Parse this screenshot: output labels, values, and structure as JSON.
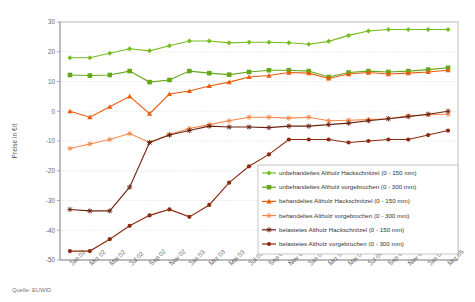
{
  "source_note": "Quelle: EUWID",
  "axes": {
    "ylabel": "Preise in €/t",
    "yticks": [
      "30",
      "20",
      "10",
      "0",
      "-10",
      "-20",
      "-30",
      "-40",
      "-50"
    ],
    "xticks": [
      "Jan 02",
      "Mrz 02",
      "Mai 02",
      "Jul 02",
      "Sep 02",
      "Nov 02",
      "Jan 03",
      "Mrz 03",
      "Mai 03",
      "Jul 03",
      "Sep 03",
      "Nov 03",
      "Jan 04",
      "Mrz 04",
      "Mai 04",
      "Jul 04",
      "Sep 04",
      "Nov 04",
      "Jan 05",
      "Mrz 05"
    ]
  },
  "legend": {
    "items": [
      {
        "label": "unbehandeltes Altholz Hackschnitzel (0 - 150 mm)",
        "color": "#76bc21",
        "marker": "diamond-marker"
      },
      {
        "label": "unbehandeltes Altholz vorgebrochen (0 - 300 mm)",
        "color": "#64a81a",
        "marker": "square-marker"
      },
      {
        "label": "behandeltes Altholz Hackschnitzel (0 - 150 mm)",
        "color": "#ea5b0c",
        "marker": "triangle-marker"
      },
      {
        "label": "behandeltes Altholz vorgebrochen (0 - 300 mm)",
        "color": "#f3874a",
        "marker": "star-marker"
      },
      {
        "label": "belastetes Altholz Hackschnitzel (0 - 150 mm)",
        "color": "#6b2412",
        "marker": "star-marker"
      },
      {
        "label": "belastetes Altholz vorgebrochen (0 - 300 mm)",
        "color": "#8c2a10",
        "marker": "circle-marker"
      }
    ]
  },
  "chart_data": {
    "type": "line",
    "title": "",
    "xlabel": "",
    "ylabel": "Preise in €/t",
    "ylim": [
      -50,
      30
    ],
    "grid": true,
    "legend_position": "inside-bottom-right",
    "x": [
      "Jan 02",
      "Mrz 02",
      "Mai 02",
      "Jul 02",
      "Sep 02",
      "Nov 02",
      "Jan 03",
      "Mrz 03",
      "Mai 03",
      "Jul 03",
      "Sep 03",
      "Nov 03",
      "Jan 04",
      "Mrz 04",
      "Mai 04",
      "Jul 04",
      "Sep 04",
      "Nov 04",
      "Jan 05",
      "Mrz 05"
    ],
    "series": [
      {
        "name": "unbehandeltes Altholz Hackschnitzel (0 - 150 mm)",
        "color": "#76bc21",
        "marker": "diamond-marker",
        "values": [
          18.0,
          18.0,
          19.5,
          21.0,
          20.3,
          22.0,
          23.6,
          23.6,
          23.0,
          23.2,
          23.2,
          23.0,
          22.5,
          23.5,
          25.5,
          27.0,
          27.5,
          27.5,
          27.5,
          27.5
        ]
      },
      {
        "name": "unbehandeltes Altholz vorgebrochen (0 - 300 mm)",
        "color": "#64a81a",
        "marker": "square-marker",
        "values": [
          12.2,
          12.0,
          12.2,
          13.5,
          9.8,
          10.5,
          13.5,
          12.8,
          12.3,
          13.2,
          13.8,
          13.8,
          13.5,
          11.5,
          13.0,
          13.5,
          13.2,
          13.5,
          14.0,
          14.6
        ]
      },
      {
        "name": "behandeltes Altholz Hackschnitzel (0 - 150 mm)",
        "color": "#ea5b0c",
        "marker": "triangle-marker",
        "values": [
          0.0,
          -2.0,
          1.5,
          5.0,
          -0.8,
          5.8,
          6.8,
          8.5,
          9.8,
          11.5,
          12.0,
          13.0,
          12.8,
          11.0,
          12.5,
          13.0,
          12.5,
          12.8,
          13.2,
          13.8
        ]
      },
      {
        "name": "behandeltes Altholz vorgebrochen (0 - 300 mm)",
        "color": "#f3874a",
        "marker": "star-marker",
        "values": [
          -12.5,
          -11.0,
          -9.5,
          -7.5,
          -10.5,
          -7.8,
          -5.8,
          -4.5,
          -3.2,
          -2.0,
          -2.0,
          -2.3,
          -2.0,
          -3.2,
          -3.0,
          -2.8,
          -2.5,
          -1.5,
          -1.2,
          -1.0
        ]
      },
      {
        "name": "belastetes Altholz Hackschnitzel (0 - 150 mm)",
        "color": "#6b2412",
        "marker": "star-marker",
        "values": [
          -33.0,
          -33.5,
          -33.5,
          -25.5,
          -10.5,
          -8.0,
          -6.5,
          -5.0,
          -5.3,
          -5.3,
          -5.5,
          -5.0,
          -5.0,
          -4.5,
          -4.0,
          -3.2,
          -2.5,
          -1.8,
          -1.0,
          0.0
        ]
      },
      {
        "name": "belastetes Altholz vorgebrochen (0 - 300 mm)",
        "color": "#8c2a10",
        "marker": "circle-marker",
        "values": [
          -47.0,
          -47.0,
          -43.0,
          -38.5,
          -35.0,
          -33.0,
          -35.5,
          -31.5,
          -24.0,
          -18.5,
          -14.5,
          -9.5,
          -9.5,
          -9.5,
          -10.5,
          -10.0,
          -9.5,
          -9.5,
          -8.0,
          -6.5
        ]
      }
    ]
  }
}
